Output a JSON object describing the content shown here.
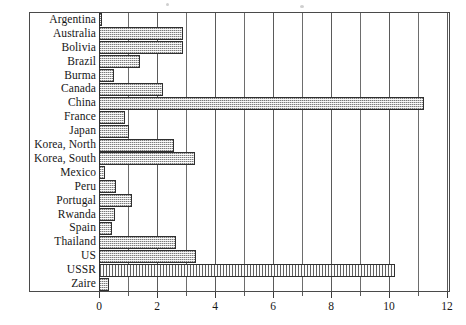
{
  "chart_data": {
    "type": "bar",
    "orientation": "horizontal",
    "title": "",
    "xlabel": "",
    "ylabel": "",
    "xlim": [
      0,
      12
    ],
    "xticks": [
      0,
      2,
      4,
      6,
      8,
      10,
      12
    ],
    "xtick_labels": [
      "0",
      "2",
      "4",
      "6",
      "8",
      "10",
      "12"
    ],
    "minor_xticks": [
      1,
      3,
      5,
      7,
      9,
      11
    ],
    "grid": true,
    "grid_axis": "x",
    "legend": null,
    "categories": [
      "Argentina",
      "Australia",
      "Bolivia",
      "Brazil",
      "Burma",
      "Canada",
      "China",
      "France",
      "Japan",
      "Korea, North",
      "Korea, South",
      "Mexico",
      "Peru",
      "Portugal",
      "Rwanda",
      "Spain",
      "Thailand",
      "US",
      "USSR",
      "Zaire"
    ],
    "values": [
      0.1,
      2.9,
      2.9,
      1.4,
      0.5,
      2.2,
      11.2,
      0.9,
      1.05,
      2.6,
      3.3,
      0.2,
      0.6,
      1.15,
      0.55,
      0.45,
      2.65,
      3.35,
      10.2,
      0.35
    ],
    "highlighted": [
      "USSR"
    ],
    "colors": {
      "bar_fill": "#c9c9c9",
      "bar_fill_highlight": "#d8d8d8",
      "bar_edge": "#2f2f2f",
      "frame": "#4a4a4a",
      "gridline": "#5a5a5a",
      "text": "#161616",
      "background": "#ffffff"
    }
  }
}
